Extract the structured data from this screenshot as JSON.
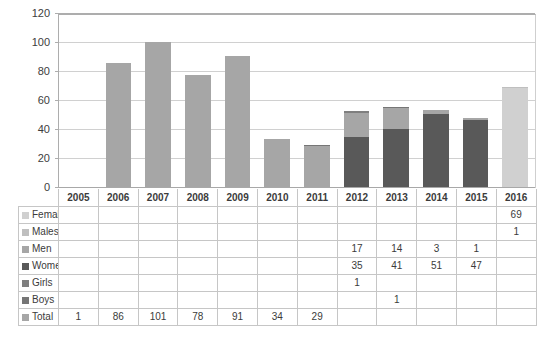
{
  "chart_data": {
    "type": "bar",
    "title": "",
    "xlabel": "",
    "ylabel": "",
    "ylim": [
      0,
      120
    ],
    "ytick_step": 20,
    "yticks": [
      "0",
      "20",
      "40",
      "60",
      "80",
      "100",
      "120"
    ],
    "grid": true,
    "legend_position": "row-headers-in-table",
    "stacked": true,
    "categories": [
      "2005",
      "2006",
      "2007",
      "2008",
      "2009",
      "2010",
      "2011",
      "2012",
      "2013",
      "2014",
      "2015",
      "2016"
    ],
    "series": [
      {
        "name": "Females",
        "color": "#D0D0D0",
        "values": [
          null,
          null,
          null,
          null,
          null,
          null,
          null,
          null,
          null,
          null,
          null,
          69
        ]
      },
      {
        "name": "Males",
        "color": "#BFBFBF",
        "values": [
          null,
          null,
          null,
          null,
          null,
          null,
          null,
          null,
          null,
          null,
          null,
          1
        ]
      },
      {
        "name": "Men",
        "color": "#A6A6A6",
        "values": [
          null,
          null,
          null,
          null,
          null,
          null,
          null,
          17,
          14,
          3,
          1,
          null
        ]
      },
      {
        "name": "Women",
        "color": "#595959",
        "values": [
          null,
          null,
          null,
          null,
          null,
          null,
          null,
          35,
          41,
          51,
          47,
          null
        ]
      },
      {
        "name": "Girls",
        "color": "#7F7F7F",
        "values": [
          null,
          null,
          null,
          null,
          null,
          null,
          null,
          1,
          null,
          null,
          null,
          null
        ]
      },
      {
        "name": "Boys",
        "color": "#767676",
        "values": [
          null,
          null,
          null,
          null,
          null,
          null,
          1,
          null,
          1,
          null,
          null,
          null
        ]
      },
      {
        "name": "Total",
        "color": "#A6A6A6",
        "values": [
          1,
          86,
          101,
          78,
          91,
          34,
          29,
          null,
          null,
          null,
          null,
          null
        ]
      }
    ]
  },
  "table": {
    "year_headers": [
      "2005",
      "2006",
      "2007",
      "2008",
      "2009",
      "2010",
      "2011",
      "2012",
      "2013",
      "2014",
      "2015",
      "2016"
    ],
    "rows": [
      {
        "label": "Females",
        "swatch": "#D0D0D0",
        "cells": [
          "",
          "",
          "",
          "",
          "",
          "",
          "",
          "",
          "",
          "",
          "",
          "69"
        ]
      },
      {
        "label": "Males",
        "swatch": "#BFBFBF",
        "cells": [
          "",
          "",
          "",
          "",
          "",
          "",
          "",
          "",
          "",
          "",
          "",
          "1"
        ]
      },
      {
        "label": "Men",
        "swatch": "#A6A6A6",
        "cells": [
          "",
          "",
          "",
          "",
          "",
          "",
          "",
          "17",
          "14",
          "3",
          "1",
          ""
        ]
      },
      {
        "label": "Women",
        "swatch": "#595959",
        "cells": [
          "",
          "",
          "",
          "",
          "",
          "",
          "",
          "35",
          "41",
          "51",
          "47",
          ""
        ]
      },
      {
        "label": "Girls",
        "swatch": "#7F7F7F",
        "cells": [
          "",
          "",
          "",
          "",
          "",
          "",
          "",
          "1",
          "",
          "",
          "",
          ""
        ]
      },
      {
        "label": "Boys",
        "swatch": "#767676",
        "cells": [
          "",
          "",
          "",
          "",
          "",
          "",
          "",
          "",
          "1",
          "",
          "",
          ""
        ]
      },
      {
        "label": "Total",
        "swatch": "#A6A6A6",
        "cells": [
          "1",
          "86",
          "101",
          "78",
          "91",
          "34",
          "29",
          "",
          "",
          "",
          "",
          ""
        ]
      }
    ]
  },
  "colors": {
    "females": "#D0D0D0",
    "males": "#BFBFBF",
    "men": "#A6A6A6",
    "women": "#595959",
    "girls": "#7F7F7F",
    "boys": "#767676",
    "total": "#A6A6A6",
    "gridline": "#D0D0D0",
    "axis": "#ADADAD",
    "table_border": "#C6C6C6",
    "text": "#3B3B3B"
  }
}
